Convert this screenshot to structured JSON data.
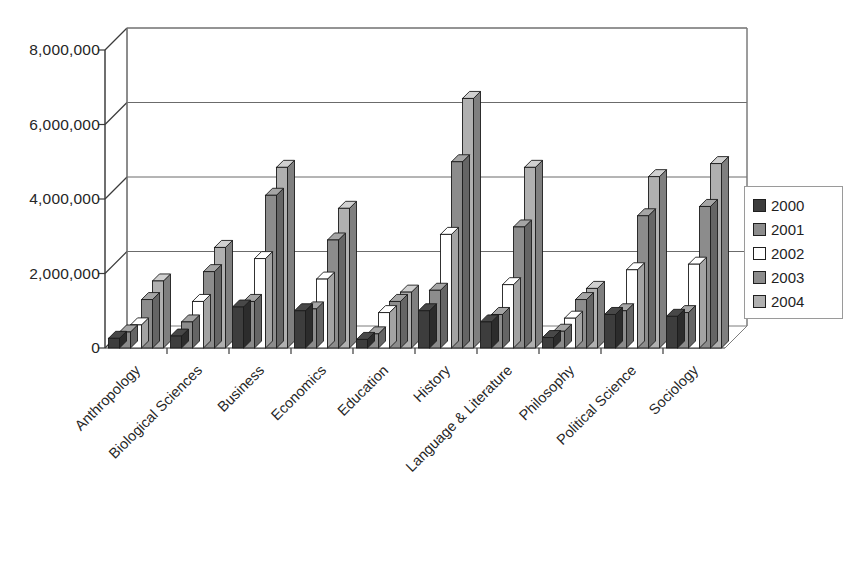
{
  "chart_data": {
    "type": "bar",
    "title": "",
    "subtitle": "",
    "xlabel": "",
    "ylabel": "",
    "ylim": [
      0,
      8000000
    ],
    "yticks": [
      0,
      2000000,
      4000000,
      6000000,
      8000000
    ],
    "ytick_labels": [
      "0",
      "2,000,000",
      "4,000,000",
      "6,000,000",
      "8,000,000"
    ],
    "grid": true,
    "legend_position": "right",
    "style": "3d-clustered-column",
    "categories": [
      "Anthropology",
      "Biological Sciences",
      "Business",
      "Economics",
      "Education",
      "History",
      "Language & Literature",
      "Philosophy",
      "Political Science",
      "Sociology"
    ],
    "series": [
      {
        "name": "2000",
        "color": "#3d3d3d",
        "values": [
          260000,
          320000,
          1100000,
          1000000,
          230000,
          1000000,
          700000,
          280000,
          900000,
          850000
        ]
      },
      {
        "name": "2001",
        "color": "#8c8c8c",
        "values": [
          430000,
          700000,
          1250000,
          1050000,
          380000,
          1550000,
          900000,
          450000,
          1000000,
          950000
        ]
      },
      {
        "name": "2002",
        "color": "#ffffff",
        "values": [
          620000,
          1250000,
          2400000,
          1850000,
          950000,
          3050000,
          1700000,
          800000,
          2100000,
          2250000
        ]
      },
      {
        "name": "2003",
        "color": "#8c8c8c",
        "values": [
          1300000,
          2050000,
          4100000,
          2900000,
          1250000,
          5000000,
          3250000,
          1300000,
          3550000,
          3800000
        ]
      },
      {
        "name": "2004",
        "color": "#b0b0b0",
        "values": [
          1800000,
          2700000,
          4850000,
          3750000,
          1500000,
          6700000,
          4850000,
          1600000,
          4600000,
          4950000
        ]
      }
    ]
  },
  "legend": {
    "items": [
      {
        "label": "2000",
        "color": "#3d3d3d"
      },
      {
        "label": "2001",
        "color": "#8c8c8c"
      },
      {
        "label": "2002",
        "color": "#ffffff"
      },
      {
        "label": "2003",
        "color": "#8c8c8c"
      },
      {
        "label": "2004",
        "color": "#b0b0b0"
      }
    ]
  }
}
